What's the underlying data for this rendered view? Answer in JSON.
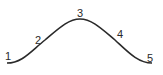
{
  "diagram": {
    "type": "bell-curve",
    "stroke_color": "#2a2a2a",
    "points": [
      {
        "label": "1",
        "x": 7,
        "y": 57
      },
      {
        "label": "2",
        "x": 39,
        "y": 40
      },
      {
        "label": "3",
        "x": 80,
        "y": 16
      },
      {
        "label": "4",
        "x": 121,
        "y": 37
      },
      {
        "label": "5",
        "x": 150,
        "y": 60
      }
    ]
  }
}
